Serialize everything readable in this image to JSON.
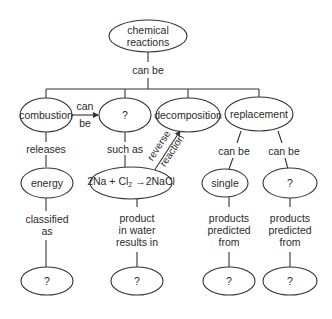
{
  "diagram": {
    "type": "concept-map",
    "nodes": {
      "root": "chemical reactions",
      "combustion": "combustion",
      "unknown_type": "?",
      "decomposition": "decomposition",
      "replacement": "replacement",
      "energy": "energy",
      "equation": {
        "lhs": "2Na + Cl",
        "subscript": "2",
        "arrow": "→",
        "rhs": "2NaCl"
      },
      "single": "single",
      "replacement_unknown": "?",
      "energy_class": "?",
      "water_result": "?",
      "single_predicted": "?",
      "other_predicted": "?"
    },
    "links": {
      "root_to_types": "can be",
      "combustion_pair_top": "can",
      "combustion_pair_bottom": "be",
      "releases": "releases",
      "such_as": "such as",
      "reverse_top": "reverse",
      "reverse_bottom": "reaction",
      "repl_can_be_1": "can be",
      "repl_can_be_2": "can be",
      "classified_1": "classified",
      "classified_2": "as",
      "product_1": "product",
      "product_2": "in water",
      "product_3": "results in",
      "pred_a_1": "products",
      "pred_a_2": "predicted",
      "pred_a_3": "from",
      "pred_b_1": "products",
      "pred_b_2": "predicted",
      "pred_b_3": "from"
    },
    "colors": {
      "line": "#333333",
      "text": "#2a2a2a",
      "background": "#ffffff"
    }
  }
}
